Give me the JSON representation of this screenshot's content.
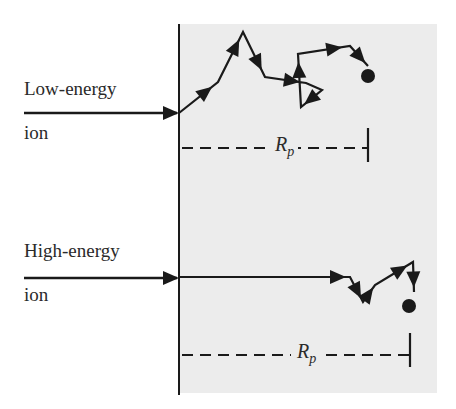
{
  "diagram": {
    "type": "ion-implantation-range-illustration",
    "colors": {
      "background": "#ffffff",
      "substrate": "#ececec",
      "stroke": "#1a1a1a",
      "text": "#2a2a2a"
    },
    "substrate": {
      "x": 180,
      "y": 24,
      "width": 257,
      "height": 369
    },
    "surface_line": {
      "x": 179,
      "y1": 24,
      "y2": 395
    },
    "ions": [
      {
        "id": "low-energy",
        "label": "Low-energy\nion",
        "label_pos": {
          "x": 24,
          "y": 54
        },
        "incoming": {
          "x1": 24,
          "x2": 179,
          "y": 113
        },
        "path": [
          [
            179,
            113
          ],
          [
            218,
            82
          ],
          [
            243,
            32
          ],
          [
            265,
            77
          ],
          [
            306,
            83
          ],
          [
            322,
            90
          ],
          [
            301,
            107
          ],
          [
            298,
            54
          ],
          [
            350,
            46
          ],
          [
            368,
            66
          ]
        ],
        "arrow_segments": [
          0,
          1,
          2,
          3,
          5,
          6,
          7,
          8
        ],
        "stop": {
          "x": 368,
          "y": 76,
          "r": 7
        },
        "range": {
          "label_main": "R",
          "label_sub": "p",
          "y": 148,
          "x1": 182,
          "x2": 368,
          "tick_y1": 128,
          "tick_y2": 162,
          "label_x": 272
        }
      },
      {
        "id": "high-energy",
        "label": "High-energy\nion",
        "label_pos": {
          "x": 24,
          "y": 220
        },
        "incoming": {
          "x1": 24,
          "x2": 179,
          "y": 278
        },
        "path": [
          [
            179,
            277
          ],
          [
            350,
            277
          ],
          [
            363,
            302
          ],
          [
            375,
            285
          ],
          [
            413,
            262
          ],
          [
            414,
            292
          ]
        ],
        "arrow_segments": [
          0,
          1,
          2,
          3,
          4
        ],
        "stop": {
          "x": 409,
          "y": 306,
          "r": 7
        },
        "range": {
          "label_main": "R",
          "label_sub": "p",
          "y": 355,
          "x1": 182,
          "x2": 410,
          "tick_y1": 333,
          "tick_y2": 367,
          "label_x": 294
        }
      }
    ]
  },
  "labels": {
    "low_energy_line1": "Low-energy",
    "low_energy_line2": "ion",
    "high_energy_line1": "High-energy",
    "high_energy_line2": "ion",
    "range_symbol": "R",
    "range_subscript": "p"
  }
}
